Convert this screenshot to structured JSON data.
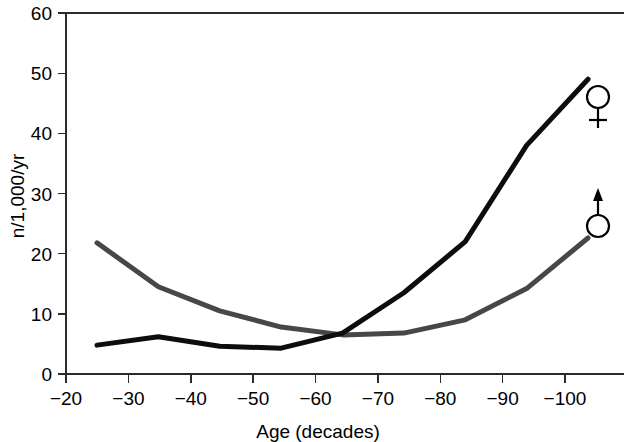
{
  "chart_data": {
    "type": "line",
    "title": "",
    "subtitle": "",
    "xlabel": "Age (decades)",
    "ylabel": "n/1,000/yr",
    "x": [
      -20,
      -30,
      -40,
      -50,
      -60,
      -70,
      -80,
      -90,
      -100
    ],
    "categories": [
      "−20",
      "−30",
      "−40",
      "−50",
      "−60",
      "−70",
      "−80",
      "−90",
      "−100"
    ],
    "xticklabels": [
      "−20",
      "−30",
      "−40",
      "−50",
      "−60",
      "−70",
      "−80",
      "−90",
      "−100"
    ],
    "yticklabels": [
      "0",
      "10",
      "20",
      "30",
      "40",
      "50",
      "60"
    ],
    "yticks": [
      0,
      10,
      20,
      30,
      40,
      50,
      60
    ],
    "xlim": [
      -20,
      -100
    ],
    "ylim": [
      0,
      60
    ],
    "grid": false,
    "legend_position": "right-inline-symbols",
    "series": [
      {
        "name": "♀",
        "symbol": "female-venus-symbol",
        "color": "#0d0d0d",
        "linewidth": 5,
        "values": [
          4.8,
          6.2,
          4.6,
          4.3,
          6.8,
          13.5,
          22.0,
          38.0,
          49.0
        ]
      },
      {
        "name": "♂",
        "symbol": "male-mars-symbol",
        "color": "#474747",
        "linewidth": 5,
        "values": [
          21.8,
          14.5,
          10.5,
          7.8,
          6.5,
          6.8,
          9.0,
          14.2,
          22.6
        ]
      }
    ],
    "annotations": [
      {
        "label": "♀",
        "name": "female-symbol",
        "x": -100,
        "y": 46.3
      },
      {
        "label": "♂",
        "name": "male-symbol",
        "x": -100,
        "y": 25.2
      }
    ],
    "colors": {
      "female_line": "#0d0d0d",
      "male_line": "#474747",
      "axis": "#2b2b2b",
      "background": "#ffffff",
      "text": "#000000"
    }
  }
}
